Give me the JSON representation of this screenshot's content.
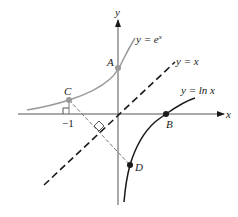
{
  "diagram": {
    "type": "graph",
    "axes": {
      "x_label": "x",
      "y_label": "y"
    },
    "curves": [
      {
        "name": "exp",
        "label": "y = e^x",
        "label_text": "y = e",
        "label_sup": "x",
        "color": "#9a9a9a"
      },
      {
        "name": "identity",
        "label": "y = x",
        "color": "#1a1a1a",
        "style": "dashed"
      },
      {
        "name": "log",
        "label": "y = ln x",
        "color": "#1a1a1a"
      }
    ],
    "points": [
      {
        "name": "A",
        "label": "A",
        "color": "#9a9a9a"
      },
      {
        "name": "B",
        "label": "B",
        "color": "#1a1a1a"
      },
      {
        "name": "C",
        "label": "C",
        "color": "#9a9a9a"
      },
      {
        "name": "D",
        "label": "D",
        "color": "#1a1a1a"
      }
    ],
    "tick_labels": {
      "neg_one": "−1"
    }
  }
}
